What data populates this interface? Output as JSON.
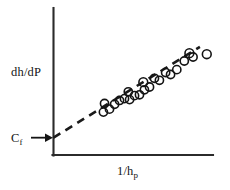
{
  "figure": {
    "kind": "scatter-plot-with-fit",
    "background_color": "#ffffff",
    "axis_color": "#2b2b2b",
    "marker_color": "#141414",
    "fit_line_color": "#1a1a1a"
  },
  "labels": {
    "ylabel_text": "dh/dP",
    "xlabel_main": "1/h",
    "xlabel_sub": "p",
    "intercept_main": "C",
    "intercept_sub": "f"
  },
  "chart_data": {
    "type": "scatter",
    "title": "",
    "xlabel": "1/h_p",
    "ylabel": "dh/dP",
    "grid": false,
    "legend": null,
    "axis_ticks": {
      "x": [],
      "y": []
    },
    "axis_arrows": false,
    "xlim": [
      0,
      1
    ],
    "ylim": [
      0,
      1
    ],
    "annotations": [
      {
        "text": "C_f",
        "meaning": "y-axis intercept of the dashed fit line",
        "arrow": true,
        "points_to": [
          0.0,
          0.122
        ]
      }
    ],
    "series": [
      {
        "name": "data points",
        "marker": "open-circle",
        "points": [
          [
            0.313,
            0.302
          ],
          [
            0.32,
            0.363
          ],
          [
            0.351,
            0.323
          ],
          [
            0.383,
            0.357
          ],
          [
            0.414,
            0.384
          ],
          [
            0.445,
            0.397
          ],
          [
            0.469,
            0.445
          ],
          [
            0.477,
            0.39
          ],
          [
            0.508,
            0.418
          ],
          [
            0.539,
            0.424
          ],
          [
            0.563,
            0.513
          ],
          [
            0.57,
            0.459
          ],
          [
            0.602,
            0.479
          ],
          [
            0.633,
            0.54
          ],
          [
            0.664,
            0.526
          ],
          [
            0.703,
            0.581
          ],
          [
            0.734,
            0.567
          ],
          [
            0.773,
            0.601
          ],
          [
            0.82,
            0.662
          ],
          [
            0.852,
            0.717
          ],
          [
            0.875,
            0.69
          ],
          [
            0.961,
            0.71
          ]
        ]
      }
    ],
    "fit_line": {
      "name": "extrapolated linear fit",
      "style": "dashed",
      "from": [
        0.0,
        0.122
      ],
      "to": [
        0.918,
        0.762
      ],
      "intercept_label": "C_f"
    }
  }
}
